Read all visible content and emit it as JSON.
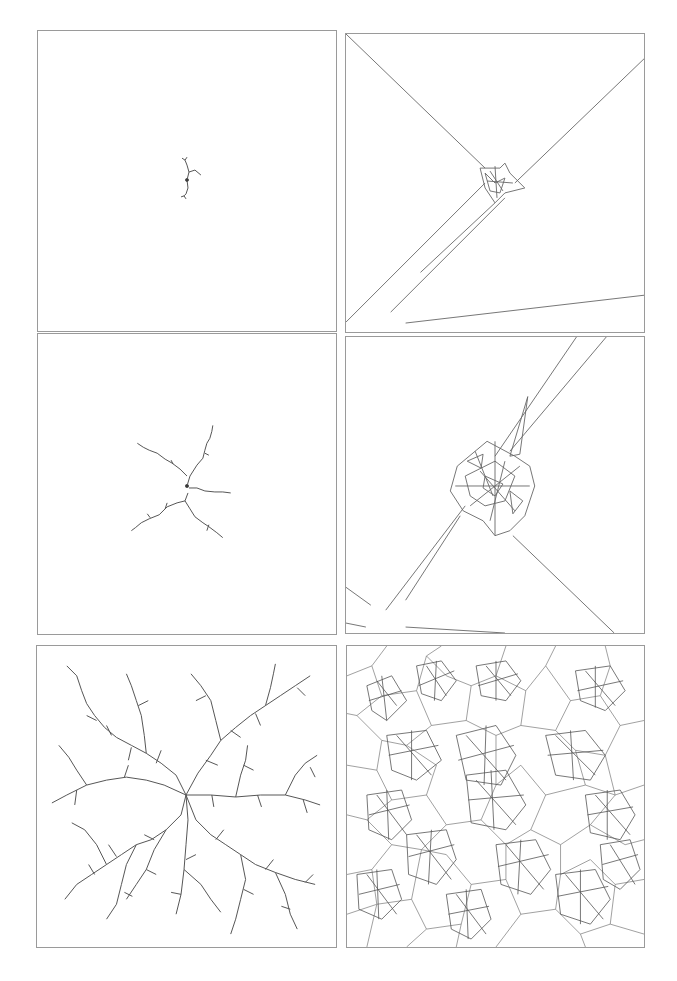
{
  "figure": {
    "layout": {
      "rows": 3,
      "cols": 2
    },
    "stroke_color": "#555555",
    "border_color": "#9a9a9a",
    "panels": [
      {
        "id": "dla-stage-1",
        "kind": "aggregate-tree",
        "stage": 1,
        "description": "Small seed cluster, a few branches"
      },
      {
        "id": "voronoi-stage-1",
        "kind": "voronoi-overlay",
        "stage": 1,
        "description": "Voronoi/Delaunay cells of stage 1 with long rays to borders"
      },
      {
        "id": "dla-stage-2",
        "kind": "aggregate-tree",
        "stage": 2,
        "description": "Five-armed branching cluster"
      },
      {
        "id": "voronoi-stage-2",
        "kind": "voronoi-overlay",
        "stage": 2,
        "description": "Dense cell cluster at center with long rays"
      },
      {
        "id": "dla-stage-3",
        "kind": "aggregate-tree",
        "stage": 3,
        "description": "Fully grown dendritic fractal filling the panel"
      },
      {
        "id": "voronoi-stage-3",
        "kind": "voronoi-overlay",
        "stage": 3,
        "description": "Dense Voronoi tessellation over the full fractal"
      }
    ]
  }
}
